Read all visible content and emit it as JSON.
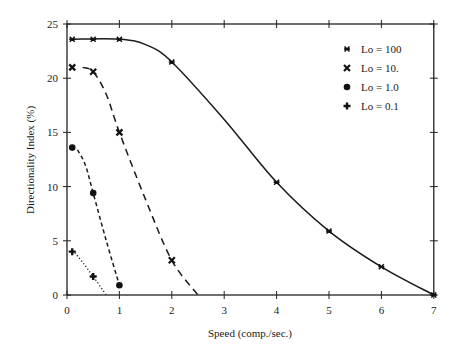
{
  "chart_data": {
    "type": "line",
    "title": "",
    "xlabel": "Speed (comp./sec.)",
    "ylabel": "Directionality Index (%)",
    "xlim": [
      0,
      7
    ],
    "ylim": [
      0,
      25
    ],
    "xticks": [
      0,
      1,
      2,
      3,
      4,
      5,
      6,
      7
    ],
    "yticks": [
      0,
      5,
      10,
      15,
      20,
      25
    ],
    "grid": false,
    "legend_position": "upper right",
    "series": [
      {
        "name": "Lo = 100",
        "marker": "x-star",
        "line_style": "solid",
        "points": [
          [
            0.1,
            23.6
          ],
          [
            0.5,
            23.6
          ],
          [
            1,
            23.6
          ],
          [
            2,
            21.5
          ],
          [
            4,
            10.4
          ],
          [
            5,
            5.9
          ],
          [
            6,
            2.6
          ],
          [
            7,
            0
          ]
        ],
        "curve": [
          [
            0.1,
            23.6
          ],
          [
            1,
            23.6
          ],
          [
            1.5,
            23.1
          ],
          [
            2,
            21.5
          ],
          [
            3,
            16.2
          ],
          [
            4,
            10.4
          ],
          [
            5,
            5.9
          ],
          [
            6,
            2.6
          ],
          [
            7,
            0
          ]
        ]
      },
      {
        "name": "Lo = 10.",
        "marker": "x-bold",
        "line_style": "dashed",
        "points": [
          [
            0.1,
            21.0
          ],
          [
            0.5,
            20.6
          ],
          [
            1,
            15.0
          ],
          [
            2,
            3.2
          ]
        ],
        "curve": [
          [
            0.3,
            21.0
          ],
          [
            0.5,
            20.6
          ],
          [
            0.75,
            18.5
          ],
          [
            1,
            15.0
          ],
          [
            1.5,
            8.8
          ],
          [
            2,
            3.2
          ],
          [
            2.5,
            0
          ]
        ]
      },
      {
        "name": "Lo = 1.0",
        "marker": "circle",
        "line_style": "short-dashed",
        "points": [
          [
            0.1,
            13.6
          ],
          [
            0.5,
            9.4
          ],
          [
            1,
            0.9
          ]
        ],
        "curve": [
          [
            0.2,
            13.4
          ],
          [
            0.35,
            12.0
          ],
          [
            0.5,
            9.4
          ],
          [
            0.75,
            5.0
          ],
          [
            1,
            0.9
          ]
        ]
      },
      {
        "name": "Lo = 0.1",
        "marker": "plus",
        "line_style": "dotted",
        "points": [
          [
            0.1,
            4.0
          ],
          [
            0.5,
            1.7
          ]
        ],
        "curve": [
          [
            0.15,
            3.9
          ],
          [
            0.3,
            3.0
          ],
          [
            0.5,
            1.7
          ],
          [
            0.75,
            0
          ]
        ]
      }
    ]
  }
}
